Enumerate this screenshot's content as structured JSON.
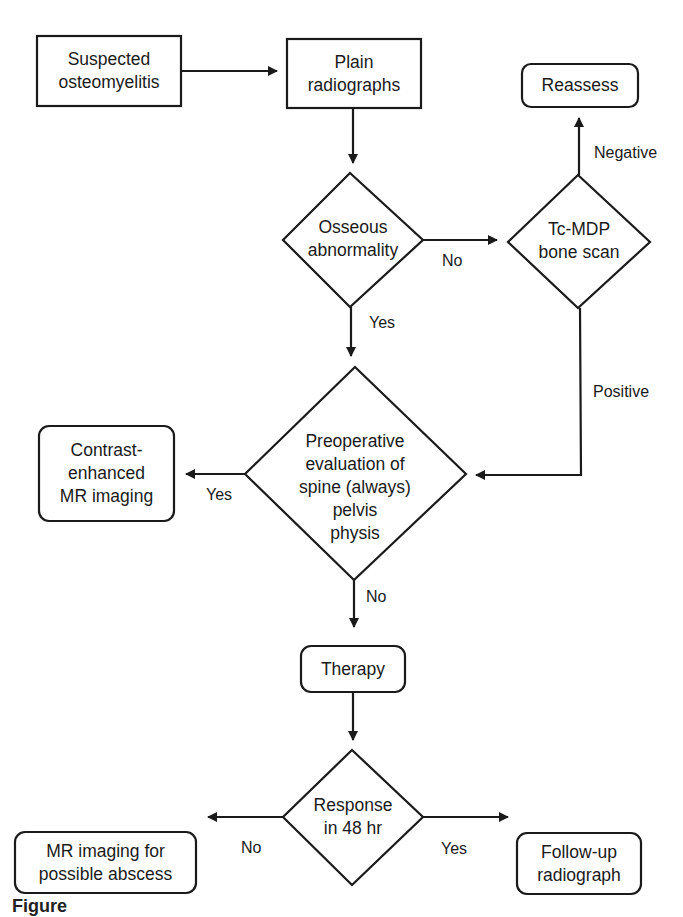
{
  "diagram": {
    "type": "flowchart",
    "nodes": {
      "suspected": {
        "shape": "rect",
        "lines": [
          "Suspected",
          "osteomyelitis"
        ]
      },
      "plain": {
        "shape": "rect",
        "lines": [
          "Plain",
          "radiographs"
        ]
      },
      "reassess": {
        "shape": "rounded-rect",
        "lines": [
          "Reassess"
        ]
      },
      "osseous": {
        "shape": "diamond",
        "lines": [
          "Osseous",
          "abnormality"
        ]
      },
      "tcmdp": {
        "shape": "diamond",
        "lines": [
          "Tc-MDP",
          "bone scan"
        ]
      },
      "preop": {
        "shape": "diamond",
        "lines": [
          "Preoperative",
          "evaluation of",
          "spine (always)",
          "pelvis",
          "physis"
        ]
      },
      "contrast": {
        "shape": "rounded-rect",
        "lines": [
          "Contrast-",
          "enhanced",
          "MR imaging"
        ]
      },
      "therapy": {
        "shape": "rounded-rect",
        "lines": [
          "Therapy"
        ]
      },
      "response": {
        "shape": "diamond",
        "lines": [
          "Response",
          "in 48 hr"
        ]
      },
      "mr_abscess": {
        "shape": "rounded-rect",
        "lines": [
          "MR imaging for",
          "possible abscess"
        ]
      },
      "followup": {
        "shape": "rounded-rect",
        "lines": [
          "Follow-up",
          "radiograph"
        ]
      }
    },
    "edges": [
      {
        "from": "suspected",
        "to": "plain",
        "label": ""
      },
      {
        "from": "plain",
        "to": "osseous",
        "label": ""
      },
      {
        "from": "osseous",
        "to": "tcmdp",
        "label": "No"
      },
      {
        "from": "osseous",
        "to": "preop",
        "label": "Yes"
      },
      {
        "from": "tcmdp",
        "to": "reassess",
        "label": "Negative"
      },
      {
        "from": "tcmdp",
        "to": "preop",
        "label": "Positive"
      },
      {
        "from": "preop",
        "to": "contrast",
        "label": "Yes"
      },
      {
        "from": "preop",
        "to": "therapy",
        "label": "No"
      },
      {
        "from": "therapy",
        "to": "response",
        "label": ""
      },
      {
        "from": "response",
        "to": "mr_abscess",
        "label": "No"
      },
      {
        "from": "response",
        "to": "followup",
        "label": "Yes"
      }
    ],
    "edge_labels": {
      "osseous_no": "No",
      "osseous_yes": "Yes",
      "tcmdp_negative": "Negative",
      "tcmdp_positive": "Positive",
      "preop_yes": "Yes",
      "preop_no": "No",
      "response_no": "No",
      "response_yes": "Yes"
    },
    "caption_fragment": "Figure",
    "colors": {
      "stroke": "#1a1a1a",
      "background": "#ffffff",
      "text": "#1a1a1a"
    }
  }
}
